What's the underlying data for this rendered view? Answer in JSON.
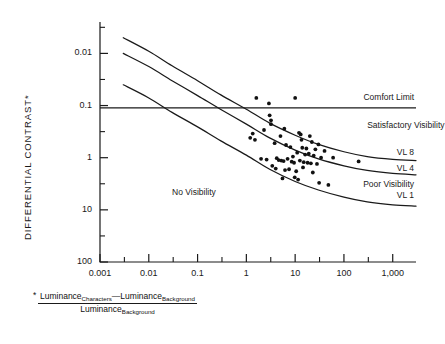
{
  "chart_data": {
    "type": "scatter",
    "title": "",
    "xlabel": "",
    "ylabel": "DIFFERENTIAL CONTRAST*",
    "xscale": "log",
    "yscale": "log",
    "xlim": [
      0.001,
      3000
    ],
    "ylim": [
      0.01,
      400
    ],
    "xticks": [
      0.001,
      0.01,
      0.1,
      1,
      10,
      100,
      1000
    ],
    "xticklabels": [
      "0.001",
      "0.01",
      "0.1",
      "1",
      "10",
      "100",
      "1,000"
    ],
    "yticks": [
      0.01,
      0.1,
      1,
      10,
      100
    ],
    "yticklabels": [
      "0.01",
      "0.1",
      "1",
      "10",
      "100"
    ],
    "grid": false,
    "legend": "none",
    "series": [
      {
        "name": "Comfort Limit",
        "type": "line",
        "description": "horizontal reference line at differential contrast 9",
        "y_value": 9,
        "x_range": [
          0.001,
          3000
        ]
      },
      {
        "name": "VL 8",
        "type": "curve",
        "description": "visibility level 8 threshold curve, decreasing with background luminance",
        "x": [
          0.003,
          0.01,
          0.03,
          0.1,
          0.3,
          1,
          3,
          10,
          30,
          100,
          300,
          1000,
          3000
        ],
        "y": [
          200,
          110,
          58,
          30,
          16,
          8.5,
          4.6,
          2.7,
          1.8,
          1.3,
          1.05,
          0.93,
          0.88
        ]
      },
      {
        "name": "VL 4",
        "type": "curve",
        "description": "visibility level 4 threshold curve",
        "x": [
          0.003,
          0.01,
          0.03,
          0.1,
          0.3,
          1,
          3,
          10,
          30,
          100,
          300,
          1000,
          3000
        ],
        "y": [
          100,
          56,
          30,
          15.5,
          8.4,
          4.4,
          2.4,
          1.4,
          0.95,
          0.7,
          0.57,
          0.5,
          0.47
        ]
      },
      {
        "name": "VL 1",
        "type": "curve",
        "description": "visibility level 1 threshold curve",
        "x": [
          0.003,
          0.01,
          0.03,
          0.1,
          0.3,
          1,
          3,
          10,
          30,
          100,
          300,
          1000,
          3000
        ],
        "y": [
          25,
          14,
          7.4,
          3.9,
          2.1,
          1.12,
          0.6,
          0.35,
          0.24,
          0.175,
          0.142,
          0.125,
          0.118
        ]
      },
      {
        "name": "Measured displays",
        "type": "scatter",
        "x": [
          1.6,
          10.0,
          2.9,
          3.0,
          3.2,
          3.2,
          2.3,
          1.35,
          1.2,
          1.5,
          6.0,
          5.0,
          12.0,
          13.0,
          13.5,
          20.0,
          22.0,
          30.0,
          14.0,
          17.0,
          26.0,
          40.0,
          3.8,
          6.5,
          8.0,
          9.0,
          11.0,
          16.0,
          19.0,
          24.0,
          34.0,
          60.0,
          2.0,
          2.6,
          4.2,
          4.6,
          5.2,
          5.8,
          7.0,
          8.5,
          9.5,
          12.5,
          15.0,
          18.0,
          21.0,
          28.0,
          200.0,
          4.0,
          6.2,
          7.5,
          10.5,
          23.0,
          9.8,
          5.5,
          11.5,
          31.0,
          48.0,
          3.4,
          14.5
        ],
        "y": [
          14.0,
          14.0,
          11.0,
          6.5,
          5.2,
          4.4,
          3.4,
          2.9,
          2.4,
          2.2,
          3.6,
          2.6,
          3.0,
          2.8,
          2.2,
          2.6,
          2.0,
          1.8,
          1.55,
          1.5,
          1.45,
          1.35,
          1.9,
          1.75,
          1.6,
          1.05,
          1.25,
          1.15,
          1.2,
          1.1,
          1.0,
          1.0,
          0.95,
          0.92,
          0.98,
          0.9,
          0.88,
          0.86,
          0.95,
          0.84,
          0.8,
          0.88,
          0.82,
          0.8,
          0.78,
          0.76,
          0.85,
          0.62,
          0.58,
          0.6,
          0.55,
          0.52,
          0.42,
          0.4,
          0.38,
          0.33,
          0.3,
          0.7,
          0.65
        ],
        "marker": "filled-circle",
        "color": "#111111"
      }
    ],
    "annotations": [
      {
        "text": "Comfort Limit",
        "x": 700,
        "y": 14.0
      },
      {
        "text": "Satisfactory Visibility",
        "x": 300,
        "y": 4.0
      },
      {
        "text": "VL 8",
        "x": 1400,
        "y": 1.25
      },
      {
        "text": "VL 4",
        "x": 1400,
        "y": 0.62
      },
      {
        "text": "Poor Visibility",
        "x": 400,
        "y": 0.3
      },
      {
        "text": "VL 1",
        "x": 1400,
        "y": 0.185
      },
      {
        "text": "No Visibility",
        "x": 0.03,
        "y": 0.21
      }
    ],
    "footnote": {
      "marker": "*",
      "numerator_a": "Luminance",
      "numerator_a_sub": "Characters",
      "numerator_minus": "—",
      "numerator_b": "Luminance",
      "numerator_b_sub": "Background",
      "denominator": "Luminance",
      "denominator_sub": "Background"
    }
  },
  "axes": {
    "y_axis_title": "DIFFERENTIAL CONTRAST*",
    "y_ticklabels": [
      "100",
      "10",
      "1",
      "0.1",
      "0.01"
    ],
    "x_ticklabels": [
      "0.001",
      "0.01",
      "0.1",
      "1",
      "10",
      "100",
      "1,000"
    ]
  },
  "labels": {
    "comfort_limit": "Comfort Limit",
    "satisfactory_visibility": "Satisfactory Visibility",
    "poor_visibility": "Poor Visibility",
    "no_visibility": "No Visibility",
    "vl8": "VL 8",
    "vl4": "VL 4",
    "vl1": "VL 1"
  },
  "colors": {
    "ink": "#1a1a1a",
    "marker": "#111111",
    "background": "#ffffff"
  }
}
